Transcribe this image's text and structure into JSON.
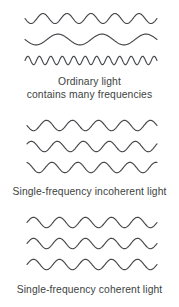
{
  "figure": {
    "background_color": "#ffffff",
    "stroke_color": "#45474a",
    "text_color": "#3d3f42"
  },
  "panels": [
    {
      "id": "ordinary",
      "caption_lines": [
        "Ordinary light",
        "contains many frequencies"
      ],
      "waves": [
        {
          "name": "wave-medium-frequency",
          "cycles": 5.5,
          "amplitude": 5.0,
          "phase_deg": 180,
          "x_start": 25,
          "x_end": 157
        },
        {
          "name": "wave-low-frequency",
          "cycles": 3.0,
          "amplitude": 5.4,
          "phase_deg": 180,
          "x_start": 25,
          "x_end": 157
        },
        {
          "name": "wave-high-frequency",
          "cycles": 11.5,
          "amplitude": 4.2,
          "phase_deg": 0,
          "x_start": 25,
          "x_end": 157
        }
      ]
    },
    {
      "id": "incoherent",
      "caption_lines": [
        "Single-frequency incoherent light"
      ],
      "waves": [
        {
          "name": "wave-phase-a",
          "cycles": 5.0,
          "amplitude": 5.2,
          "phase_deg": 180,
          "x_start": 27,
          "x_end": 157
        },
        {
          "name": "wave-phase-b",
          "cycles": 5.0,
          "amplitude": 5.2,
          "phase_deg": 30,
          "x_start": 27,
          "x_end": 157
        },
        {
          "name": "wave-phase-c",
          "cycles": 5.0,
          "amplitude": 5.2,
          "phase_deg": 105,
          "x_start": 27,
          "x_end": 157
        }
      ]
    },
    {
      "id": "coherent",
      "caption_lines": [
        "Single-frequency coherent light"
      ],
      "waves": [
        {
          "name": "wave-in-phase-1",
          "cycles": 5.0,
          "amplitude": 5.2,
          "phase_deg": 0,
          "x_start": 27,
          "x_end": 157
        },
        {
          "name": "wave-in-phase-2",
          "cycles": 5.0,
          "amplitude": 5.2,
          "phase_deg": 0,
          "x_start": 27,
          "x_end": 157
        },
        {
          "name": "wave-in-phase-3",
          "cycles": 5.0,
          "amplitude": 5.2,
          "phase_deg": 0,
          "x_start": 27,
          "x_end": 157
        }
      ]
    }
  ]
}
